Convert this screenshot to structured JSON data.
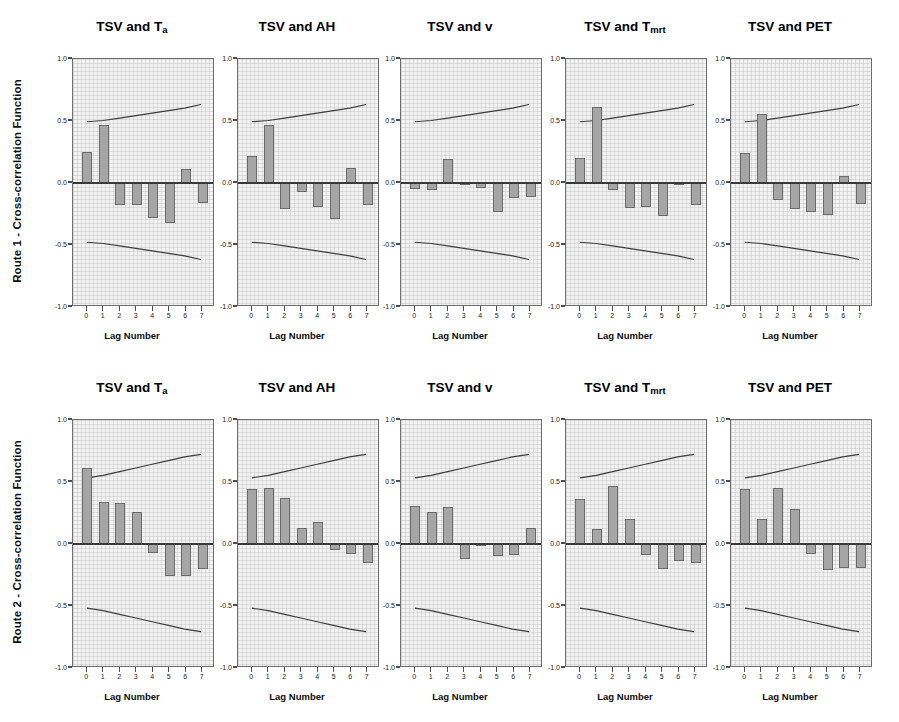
{
  "figure": {
    "background_color": "#ffffff",
    "panel_fill_color": "#f2f2f2",
    "bar_color": "#a6a6a6",
    "bar_border_color": "#6b6b6b",
    "axis_color": "#6e6e6e"
  },
  "rows": [
    {
      "ylabel": "Route 1 - Cross-correlation Function",
      "panels": [
        {
          "title_main": "TSV and T",
          "title_sub": "a",
          "xlabel": "Lag Number",
          "ytick_labels": [
            "1.0",
            "0.5",
            "0.0",
            "-0.5",
            "-1.0"
          ],
          "xtick_labels": [
            "0",
            "1",
            "2",
            "3",
            "4",
            "5",
            "6",
            "7"
          ],
          "chart_data": {
            "type": "bar",
            "title": "TSV and Ta",
            "xlabel": "Lag Number",
            "ylabel": "Route 1 - Cross-correlation Function",
            "categories": [
              "0",
              "1",
              "2",
              "3",
              "4",
              "5",
              "6",
              "7"
            ],
            "values": [
              0.25,
              0.47,
              -0.18,
              -0.18,
              -0.28,
              -0.32,
              0.11,
              -0.16
            ],
            "ylim": [
              -1.0,
              1.0
            ],
            "grid": true,
            "confidence_upper": [
              0.49,
              0.5,
              0.52,
              0.54,
              0.56,
              0.58,
              0.6,
              0.63
            ],
            "confidence_lower": [
              -0.49,
              -0.5,
              -0.52,
              -0.54,
              -0.56,
              -0.58,
              -0.6,
              -0.63
            ]
          }
        },
        {
          "title_main": "TSV and AH",
          "title_sub": "",
          "xlabel": "Lag Number",
          "ytick_labels": [
            "1.0",
            "0.5",
            "0.0",
            "-0.5",
            "-1.0"
          ],
          "xtick_labels": [
            "0",
            "1",
            "2",
            "3",
            "4",
            "5",
            "6",
            "7"
          ],
          "chart_data": {
            "type": "bar",
            "title": "TSV and AH",
            "xlabel": "Lag Number",
            "ylabel": "Route 1 - Cross-correlation Function",
            "categories": [
              "0",
              "1",
              "2",
              "3",
              "4",
              "5",
              "6",
              "7"
            ],
            "values": [
              0.22,
              0.47,
              -0.21,
              -0.07,
              -0.19,
              -0.29,
              0.12,
              -0.18
            ],
            "ylim": [
              -1.0,
              1.0
            ],
            "grid": true,
            "confidence_upper": [
              0.49,
              0.5,
              0.52,
              0.54,
              0.56,
              0.58,
              0.6,
              0.63
            ],
            "confidence_lower": [
              -0.49,
              -0.5,
              -0.52,
              -0.54,
              -0.56,
              -0.58,
              -0.6,
              -0.63
            ]
          }
        },
        {
          "title_main": "TSV and v",
          "title_sub": "",
          "xlabel": "Lag Number",
          "ytick_labels": [
            "1.0",
            "0.5",
            "0.0",
            "-0.5",
            "-1.0"
          ],
          "xtick_labels": [
            "0",
            "1",
            "2",
            "3",
            "4",
            "5",
            "6",
            "7"
          ],
          "chart_data": {
            "type": "bar",
            "title": "TSV and v",
            "xlabel": "Lag Number",
            "ylabel": "Route 1 - Cross-correlation Function",
            "categories": [
              "0",
              "1",
              "2",
              "3",
              "4",
              "5",
              "6",
              "7"
            ],
            "values": [
              -0.05,
              -0.06,
              0.19,
              -0.01,
              -0.04,
              -0.23,
              -0.12,
              -0.11
            ],
            "ylim": [
              -1.0,
              1.0
            ],
            "grid": true,
            "confidence_upper": [
              0.49,
              0.5,
              0.52,
              0.54,
              0.56,
              0.58,
              0.6,
              0.63
            ],
            "confidence_lower": [
              -0.49,
              -0.5,
              -0.52,
              -0.54,
              -0.56,
              -0.58,
              -0.6,
              -0.63
            ]
          }
        },
        {
          "title_main": "TSV and T",
          "title_sub": "mrt",
          "xlabel": "Lag Number",
          "ytick_labels": [
            "1.0",
            "0.5",
            "0.0",
            "-0.5",
            "-1.0"
          ],
          "xtick_labels": [
            "0",
            "1",
            "2",
            "3",
            "4",
            "5",
            "6",
            "7"
          ],
          "chart_data": {
            "type": "bar",
            "title": "TSV and Tmrt",
            "xlabel": "Lag Number",
            "ylabel": "Route 1 - Cross-correlation Function",
            "categories": [
              "0",
              "1",
              "2",
              "3",
              "4",
              "5",
              "6",
              "7"
            ],
            "values": [
              0.2,
              0.61,
              -0.06,
              -0.2,
              -0.19,
              -0.27,
              -0.02,
              -0.18
            ],
            "ylim": [
              -1.0,
              1.0
            ],
            "grid": true,
            "confidence_upper": [
              0.49,
              0.5,
              0.52,
              0.54,
              0.56,
              0.58,
              0.6,
              0.63
            ],
            "confidence_lower": [
              -0.49,
              -0.5,
              -0.52,
              -0.54,
              -0.56,
              -0.58,
              -0.6,
              -0.63
            ]
          }
        },
        {
          "title_main": "TSV and PET",
          "title_sub": "",
          "xlabel": "Lag Number",
          "ytick_labels": [
            "1.0",
            "0.5",
            "0.0",
            "-0.5",
            "-1.0"
          ],
          "xtick_labels": [
            "0",
            "1",
            "2",
            "3",
            "4",
            "5",
            "6",
            "7"
          ],
          "chart_data": {
            "type": "bar",
            "title": "TSV and PET",
            "xlabel": "Lag Number",
            "ylabel": "Route 1 - Cross-correlation Function",
            "categories": [
              "0",
              "1",
              "2",
              "3",
              "4",
              "5",
              "6",
              "7"
            ],
            "values": [
              0.24,
              0.56,
              -0.14,
              -0.21,
              -0.23,
              -0.26,
              0.06,
              -0.17
            ],
            "ylim": [
              -1.0,
              1.0
            ],
            "grid": true,
            "confidence_upper": [
              0.49,
              0.5,
              0.52,
              0.54,
              0.56,
              0.58,
              0.6,
              0.63
            ],
            "confidence_lower": [
              -0.49,
              -0.5,
              -0.52,
              -0.54,
              -0.56,
              -0.58,
              -0.6,
              -0.63
            ]
          }
        }
      ]
    },
    {
      "ylabel": "Route 2 - Cross-correlation Function",
      "panels": [
        {
          "title_main": "TSV and T",
          "title_sub": "a",
          "xlabel": "Lag Number",
          "ytick_labels": [
            "1.0",
            "0.5",
            "0.0",
            "-0.5",
            "-1.0"
          ],
          "xtick_labels": [
            "0",
            "1",
            "2",
            "3",
            "4",
            "5",
            "6",
            "7"
          ],
          "chart_data": {
            "type": "bar",
            "title": "TSV and Ta",
            "xlabel": "Lag Number",
            "ylabel": "Route 2 - Cross-correlation Function",
            "categories": [
              "0",
              "1",
              "2",
              "3",
              "4",
              "5",
              "6",
              "7"
            ],
            "values": [
              0.61,
              0.34,
              0.33,
              0.26,
              -0.07,
              -0.26,
              -0.26,
              -0.2
            ],
            "ylim": [
              -1.0,
              1.0
            ],
            "grid": true,
            "confidence_upper": [
              0.53,
              0.55,
              0.58,
              0.61,
              0.64,
              0.67,
              0.7,
              0.72
            ],
            "confidence_lower": [
              -0.53,
              -0.55,
              -0.58,
              -0.61,
              -0.64,
              -0.67,
              -0.7,
              -0.72
            ]
          }
        },
        {
          "title_main": "TSV and AH",
          "title_sub": "",
          "xlabel": "Lag Number",
          "ytick_labels": [
            "1.0",
            "0.5",
            "0.0",
            "-0.5",
            "-1.0"
          ],
          "xtick_labels": [
            "0",
            "1",
            "2",
            "3",
            "4",
            "5",
            "6",
            "7"
          ],
          "chart_data": {
            "type": "bar",
            "title": "TSV and AH",
            "xlabel": "Lag Number",
            "ylabel": "Route 2 - Cross-correlation Function",
            "categories": [
              "0",
              "1",
              "2",
              "3",
              "4",
              "5",
              "6",
              "7"
            ],
            "values": [
              0.44,
              0.45,
              0.37,
              0.13,
              0.18,
              -0.05,
              -0.08,
              -0.15
            ],
            "ylim": [
              -1.0,
              1.0
            ],
            "grid": true,
            "confidence_upper": [
              0.53,
              0.55,
              0.58,
              0.61,
              0.64,
              0.67,
              0.7,
              0.72
            ],
            "confidence_lower": [
              -0.53,
              -0.55,
              -0.58,
              -0.61,
              -0.64,
              -0.67,
              -0.7,
              -0.72
            ]
          }
        },
        {
          "title_main": "TSV and v",
          "title_sub": "",
          "xlabel": "Lag Number",
          "ytick_labels": [
            "1.0",
            "0.5",
            "0.0",
            "-0.5",
            "-1.0"
          ],
          "xtick_labels": [
            "0",
            "1",
            "2",
            "3",
            "4",
            "5",
            "6",
            "7"
          ],
          "chart_data": {
            "type": "bar",
            "title": "TSV and v",
            "xlabel": "Lag Number",
            "ylabel": "Route 2 - Cross-correlation Function",
            "categories": [
              "0",
              "1",
              "2",
              "3",
              "4",
              "5",
              "6",
              "7"
            ],
            "values": [
              0.31,
              0.26,
              0.3,
              -0.12,
              -0.01,
              -0.1,
              -0.09,
              0.13
            ],
            "ylim": [
              -1.0,
              1.0
            ],
            "grid": true,
            "confidence_upper": [
              0.53,
              0.55,
              0.58,
              0.61,
              0.64,
              0.67,
              0.7,
              0.72
            ],
            "confidence_lower": [
              -0.53,
              -0.55,
              -0.58,
              -0.61,
              -0.64,
              -0.67,
              -0.7,
              -0.72
            ]
          }
        },
        {
          "title_main": "TSV and T",
          "title_sub": "mrt",
          "xlabel": "Lag Number",
          "ytick_labels": [
            "1.0",
            "0.5",
            "0.0",
            "-0.5",
            "-1.0"
          ],
          "xtick_labels": [
            "0",
            "1",
            "2",
            "3",
            "4",
            "5",
            "6",
            "7"
          ],
          "chart_data": {
            "type": "bar",
            "title": "TSV and Tmrt",
            "xlabel": "Lag Number",
            "ylabel": "Route 2 - Cross-correlation Function",
            "categories": [
              "0",
              "1",
              "2",
              "3",
              "4",
              "5",
              "6",
              "7"
            ],
            "values": [
              0.36,
              0.12,
              0.47,
              0.2,
              -0.09,
              -0.2,
              -0.14,
              -0.15
            ],
            "ylim": [
              -1.0,
              1.0
            ],
            "grid": true,
            "confidence_upper": [
              0.53,
              0.55,
              0.58,
              0.61,
              0.64,
              0.67,
              0.7,
              0.72
            ],
            "confidence_lower": [
              -0.53,
              -0.55,
              -0.58,
              -0.61,
              -0.64,
              -0.67,
              -0.7,
              -0.72
            ]
          }
        },
        {
          "title_main": "TSV and PET",
          "title_sub": "",
          "xlabel": "Lag Number",
          "ytick_labels": [
            "1.0",
            "0.5",
            "0.0",
            "-0.5",
            "-1.0"
          ],
          "xtick_labels": [
            "0",
            "1",
            "2",
            "3",
            "4",
            "5",
            "6",
            "7"
          ],
          "chart_data": {
            "type": "bar",
            "title": "TSV and PET",
            "xlabel": "Lag Number",
            "ylabel": "Route 2 - Cross-correlation Function",
            "categories": [
              "0",
              "1",
              "2",
              "3",
              "4",
              "5",
              "6",
              "7"
            ],
            "values": [
              0.44,
              0.2,
              0.45,
              0.28,
              -0.08,
              -0.21,
              -0.19,
              -0.19
            ],
            "ylim": [
              -1.0,
              1.0
            ],
            "grid": true,
            "confidence_upper": [
              0.53,
              0.55,
              0.58,
              0.61,
              0.64,
              0.67,
              0.7,
              0.72
            ],
            "confidence_lower": [
              -0.53,
              -0.55,
              -0.58,
              -0.61,
              -0.64,
              -0.67,
              -0.7,
              -0.72
            ]
          }
        }
      ]
    }
  ]
}
